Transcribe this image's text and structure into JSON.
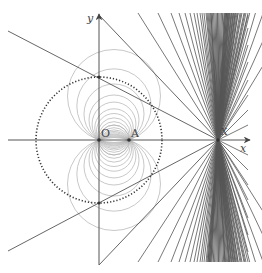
{
  "labels": {
    "y_axis": "y",
    "x_axis": "x",
    "origin": "O",
    "point_a": "A",
    "point_x": "X"
  },
  "geometry": {
    "origin": [
      99,
      140
    ],
    "point_a": [
      129,
      140
    ],
    "point_x": [
      218,
      140
    ],
    "dotted_circle": {
      "cx": 99,
      "cy": 140,
      "r": 63
    },
    "grey_circle_center_x": 114,
    "grey_circle_offsets": [
      0,
      3,
      6,
      9,
      12,
      16,
      20,
      26,
      34,
      44
    ],
    "top_fan_x": [
      138,
      158,
      171,
      179,
      185,
      190,
      194,
      197,
      200,
      202,
      204,
      206,
      207,
      208,
      209,
      210,
      211
    ],
    "top_fan_right_x": [
      229,
      230,
      231,
      232,
      233,
      234,
      235,
      236,
      237,
      238,
      240,
      242,
      244,
      246,
      248
    ],
    "right_fan_y_top": [
      15,
      28,
      45,
      62,
      80,
      95,
      110,
      125
    ],
    "right_fan_y_bottom": [
      155,
      170,
      185,
      200,
      218,
      235,
      252
    ]
  },
  "colors": {
    "axis": "#555555",
    "line": "#555555",
    "dotted_circle": "#333333",
    "grey_circles": "#b0b0b0",
    "background": "#ffffff"
  }
}
